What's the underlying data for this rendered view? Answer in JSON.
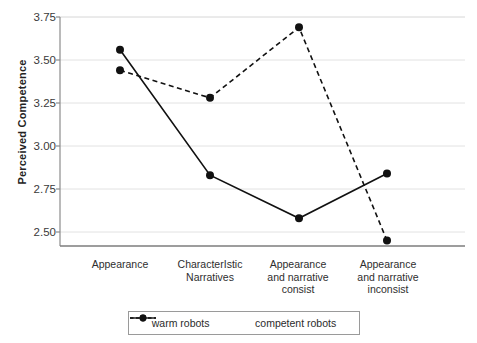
{
  "chart_data": {
    "type": "line",
    "title": "",
    "xlabel": "",
    "ylabel": "Perceived Competence",
    "ylim": [
      2.4,
      3.75
    ],
    "yticks": [
      "2.50",
      "2.75",
      "3.00",
      "3.25",
      "3.50",
      "3.75"
    ],
    "ytick_values": [
      2.5,
      2.75,
      3.0,
      3.25,
      3.5,
      3.75
    ],
    "grid": true,
    "legend_position": "bottom",
    "categories": [
      "Appearance",
      "CharacterIstic Narratives",
      "Appearance and narrative consist",
      "Appearance and narrative inconsist"
    ],
    "category_lines": [
      [
        "Appearance"
      ],
      [
        "CharacterIstic",
        "Narratives"
      ],
      [
        "Appearance",
        "and narrative",
        "consist"
      ],
      [
        "Appearance",
        "and narrative",
        "inconsist"
      ]
    ],
    "series": [
      {
        "name": "warm robots",
        "style": "solid",
        "marker": "circle",
        "color": "#111111",
        "values": [
          3.56,
          2.83,
          2.58,
          2.84
        ]
      },
      {
        "name": "competent robots",
        "style": "dashed",
        "marker": "circle",
        "color": "#111111",
        "values": [
          3.44,
          3.28,
          3.69,
          2.45
        ]
      }
    ]
  },
  "axis": {
    "ylabel": "Perceived Competence"
  },
  "legend": {
    "items": [
      {
        "label": "warm robots",
        "style": "solid"
      },
      {
        "label": "competent robots",
        "style": "dashed"
      }
    ]
  }
}
